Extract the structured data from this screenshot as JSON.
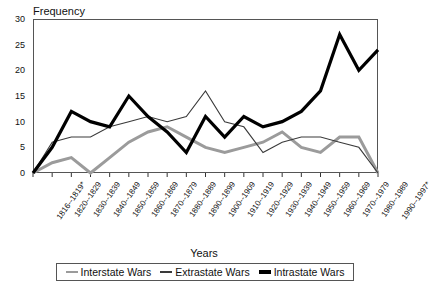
{
  "chart_data": {
    "type": "line",
    "title": "",
    "ylabel": "Frequency",
    "xlabel": "Years",
    "ylim": [
      0,
      30
    ],
    "yticks": [
      0,
      5,
      10,
      15,
      20,
      25,
      30
    ],
    "grid": false,
    "legend_position": "bottom",
    "categories": [
      "1816--1819*",
      "1820--1829",
      "1830--1839",
      "1840--1849",
      "1850--1859",
      "1860--1869",
      "1870--1879",
      "1880--1889",
      "1890--1899",
      "1900--1909",
      "1910--1919",
      "1920--1929",
      "1930--1939",
      "1940--1949",
      "1950--1959",
      "1960--1969",
      "1970--1979",
      "1980--1989",
      "1990--1997*"
    ],
    "series": [
      {
        "name": "Interstate Wars",
        "color": "#9b9b9b",
        "values": [
          0,
          2,
          3,
          0,
          3,
          6,
          8,
          9,
          7,
          5,
          4,
          5,
          6,
          8,
          5,
          4,
          7,
          7,
          0
        ]
      },
      {
        "name": "Extrastate Wars",
        "color": "#3a3a3a",
        "values": [
          0,
          6,
          7,
          7,
          9,
          10,
          11,
          10,
          11,
          16,
          10,
          9,
          4,
          6,
          7,
          7,
          6,
          5,
          0
        ]
      },
      {
        "name": "Intrastate Wars",
        "color": "#000000",
        "values": [
          0,
          5,
          12,
          10,
          9,
          15,
          11,
          8,
          4,
          11,
          7,
          11,
          9,
          10,
          12,
          16,
          27,
          20,
          24
        ]
      }
    ]
  },
  "legend": {
    "items": [
      {
        "label": "Interstate Wars"
      },
      {
        "label": "Extrastate Wars"
      },
      {
        "label": "Intrastate Wars"
      }
    ]
  }
}
